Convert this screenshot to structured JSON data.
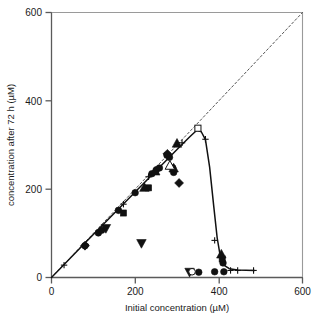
{
  "chart_data": {
    "type": "scatter",
    "title": "",
    "xlabel": "Initial concentration (µM)",
    "ylabel": "concentration after 72 h (µM)",
    "xlim": [
      0,
      600
    ],
    "ylim": [
      0,
      600
    ],
    "xticks": [
      0,
      200,
      400,
      600
    ],
    "yticks": [
      0,
      200,
      400,
      600
    ],
    "xtick_labels": [
      "0",
      "200",
      "400",
      "600"
    ],
    "ytick_labels": [
      "0",
      "200",
      "400",
      "600"
    ],
    "grid": false,
    "legend": "none",
    "annotations": [
      {
        "name": "identity-line",
        "description": "dashed diagonal reference line y = x",
        "style": "dashed",
        "color": "#555555",
        "points": [
          [
            0,
            0
          ],
          [
            600,
            600
          ]
        ]
      },
      {
        "name": "fitted-curve",
        "description": "solid fitted curve rising along diagonal to a peak near 350 uM then dropping steeply to baseline",
        "style": "solid",
        "color": "#111111",
        "points": [
          [
            0,
            0
          ],
          [
            80,
            78
          ],
          [
            160,
            155
          ],
          [
            240,
            232
          ],
          [
            300,
            290
          ],
          [
            330,
            318
          ],
          [
            348,
            334
          ],
          [
            358,
            330
          ],
          [
            368,
            312
          ],
          [
            378,
            250
          ],
          [
            388,
            160
          ],
          [
            396,
            90
          ],
          [
            404,
            45
          ],
          [
            412,
            28
          ],
          [
            425,
            20
          ],
          [
            445,
            17
          ],
          [
            485,
            16
          ]
        ]
      }
    ],
    "series": [
      {
        "name": "filled-circle",
        "marker": "circle",
        "fill": "#111111",
        "points": [
          [
            80,
            72
          ],
          [
            112,
            101
          ],
          [
            120,
            107
          ],
          [
            160,
            152
          ],
          [
            200,
            192
          ],
          [
            240,
            235
          ],
          [
            250,
            243
          ],
          [
            258,
            248
          ],
          [
            276,
            277
          ],
          [
            282,
            272
          ],
          [
            290,
            248
          ],
          [
            292,
            238
          ],
          [
            352,
            12
          ],
          [
            390,
            13
          ],
          [
            412,
            13
          ],
          [
            410,
            33
          ]
        ]
      },
      {
        "name": "filled-square",
        "marker": "square",
        "fill": "#111111",
        "points": [
          [
            172,
            146
          ],
          [
            232,
            203
          ],
          [
            408,
            42
          ]
        ]
      },
      {
        "name": "filled-up-triangle",
        "marker": "triangle-up",
        "fill": "#111111",
        "points": [
          [
            222,
            203
          ],
          [
            248,
            240
          ],
          [
            292,
            247
          ],
          [
            300,
            303
          ],
          [
            406,
            52
          ]
        ]
      },
      {
        "name": "filled-down-triangle",
        "marker": "triangle-down",
        "fill": "#111111",
        "points": [
          [
            130,
            112
          ],
          [
            215,
            78
          ],
          [
            330,
            13
          ]
        ]
      },
      {
        "name": "filled-diamond",
        "marker": "diamond",
        "fill": "#111111",
        "points": [
          [
            80,
            72
          ],
          [
            277,
            280
          ],
          [
            305,
            214
          ]
        ]
      },
      {
        "name": "open-square",
        "marker": "square-open",
        "fill": "#ffffff",
        "points": [
          [
            350,
            338
          ]
        ]
      },
      {
        "name": "open-triangle",
        "marker": "triangle-up-open",
        "fill": "#ffffff",
        "points": [
          [
            283,
            253
          ]
        ]
      },
      {
        "name": "open-circle",
        "marker": "circle-open",
        "fill": "#ffffff",
        "points": [
          [
            336,
            13
          ]
        ]
      },
      {
        "name": "plus",
        "marker": "plus",
        "fill": "#111111",
        "points": [
          [
            30,
            28
          ],
          [
            82,
            75
          ],
          [
            172,
            166
          ],
          [
            232,
            228
          ],
          [
            312,
            305
          ],
          [
            368,
            313
          ],
          [
            390,
            84
          ],
          [
            428,
            16
          ],
          [
            445,
            16
          ],
          [
            483,
            16
          ]
        ]
      }
    ]
  }
}
